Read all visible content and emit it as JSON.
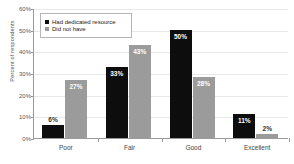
{
  "chart_data": {
    "type": "bar",
    "title": "",
    "xlabel": "",
    "ylabel": "Percent of respondents",
    "categories": [
      "Poor",
      "Fair",
      "Good",
      "Excellent"
    ],
    "series": [
      {
        "name": "Had dedicated resource",
        "color": "#0d0d0d",
        "values": [
          6,
          33,
          50,
          11
        ],
        "labels": [
          "6%",
          "33%",
          "50%",
          "11%"
        ]
      },
      {
        "name": "Did not have",
        "color": "#9b9b9b",
        "values": [
          27,
          43,
          28,
          2
        ],
        "labels": [
          "27%",
          "43%",
          "28%",
          "2%"
        ]
      }
    ],
    "ylim": [
      0,
      60
    ],
    "yticks": [
      0,
      10,
      20,
      30,
      40,
      50,
      60
    ],
    "ytick_labels": [
      "0%",
      "10%",
      "20%",
      "30%",
      "40%",
      "50%",
      "60%"
    ],
    "grid": true,
    "legend_position": "upper-left"
  },
  "title_remnant": "",
  "legend": {
    "entries": [
      {
        "label": "Had dedicated resource"
      },
      {
        "label": "Did not have"
      }
    ]
  }
}
